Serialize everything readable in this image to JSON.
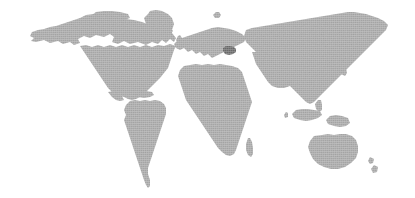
{
  "figure": {
    "type": "world-map",
    "projection": "equirectangular",
    "width": 415,
    "height": 198
  },
  "colors": {
    "background": "#ffffff",
    "land": "#a9a9a9",
    "land_edge": "#b4b4b4",
    "highlight": "#6b6b6b"
  },
  "highlight": {
    "name": "Ukraine",
    "label": "Ukraine",
    "continent": "Europe",
    "color": "#6b6b6b",
    "pixel_center_x": 231,
    "pixel_center_y": 50
  },
  "regions": [
    {
      "name": "north-america",
      "label": "North America"
    },
    {
      "name": "south-america",
      "label": "South America"
    },
    {
      "name": "europe",
      "label": "Europe"
    },
    {
      "name": "africa",
      "label": "Africa"
    },
    {
      "name": "asia",
      "label": "Asia"
    },
    {
      "name": "australia",
      "label": "Australia"
    },
    {
      "name": "new-zealand",
      "label": "New Zealand"
    },
    {
      "name": "greenland",
      "label": "Greenland"
    },
    {
      "name": "madagascar",
      "label": "Madagascar"
    },
    {
      "name": "japan",
      "label": "Japan"
    },
    {
      "name": "british-isles",
      "label": "British Isles"
    },
    {
      "name": "indonesia",
      "label": "Indonesia"
    },
    {
      "name": "philippines",
      "label": "Philippines"
    },
    {
      "name": "caribbean",
      "label": "Caribbean"
    },
    {
      "name": "iceland",
      "label": "Iceland"
    },
    {
      "name": "sri-lanka",
      "label": "Sri Lanka"
    },
    {
      "name": "new-guinea",
      "label": "New Guinea"
    },
    {
      "name": "svalbard",
      "label": "Svalbard"
    },
    {
      "name": "canadian-arctic",
      "label": "Canadian Arctic Islands"
    }
  ],
  "shapes": {
    "north_america": "M32,32 L30,36 L34,38 L31,41 L36,42 L44,40 L50,43 L58,41 L63,44 L70,42 L74,45 L80,43 L78,39 L84,36 L90,38 L96,35 L104,37 L110,34 L114,37 L112,42 L118,44 L124,41 L130,44 L138,42 L146,45 L152,42 L158,44 L162,40 L166,43 L170,39 L174,42 L176,38 L172,33 L166,30 L158,28 L150,25 L142,22 L134,20 L126,19 L118,17 L110,16 L102,15 L94,14 L86,15 L80,18 L74,20 L68,22 L62,24 L56,26 L50,27 L44,29 L38,30 Z M80,46 L84,52 L88,58 L92,64 L96,70 L100,76 L104,82 L108,88 L112,92 L118,95 L124,97 L128,99 L132,100 L136,99 L140,97 L144,94 L148,90 L152,86 L156,82 L160,78 L164,73 L168,68 L170,62 L172,56 L174,50 L176,46 L170,44 L164,46 L158,45 L152,47 L146,45 L140,47 L134,45 L128,47 L122,45 L116,47 L110,45 L104,47 L98,45 L92,47 L86,45 Z M108,92 L112,97 L116,100 L120,101 L124,100 L122,96 L118,93 L114,91 Z",
    "greenland": "M148,14 L144,18 L146,24 L150,30 L156,34 L162,36 L168,34 L172,30 L174,24 L172,18 L168,14 L162,11 L156,10 L150,11 Z",
    "south_america": "M130,101 L126,105 L124,110 L126,115 L124,120 L126,126 L128,132 L130,138 L132,144 L134,150 L136,156 L138,162 L140,168 L142,174 L144,180 L146,185 L148,188 L150,186 L150,180 L148,174 L148,168 L150,162 L152,156 L154,150 L156,144 L158,138 L160,132 L162,126 L164,120 L166,114 L166,108 L164,104 L160,101 L155,100 L150,101 L145,100 L140,101 L135,100 Z",
    "africa": "M184,66 L180,70 L178,76 L180,82 L182,88 L184,94 L186,100 L190,106 L194,112 L198,118 L202,124 L206,130 L210,136 L214,142 L218,148 L222,152 L226,155 L230,156 L234,154 L236,150 L238,144 L240,138 L242,132 L244,126 L246,120 L248,114 L250,108 L252,102 L250,96 L248,90 L246,84 L244,78 L242,72 L238,68 L232,66 L226,65 L220,64 L214,65 L208,64 L202,65 L196,64 L190,65 Z",
    "madagascar": "M248,138 L246,144 L246,150 L248,155 L251,157 L253,154 L253,148 L252,142 L250,138 Z",
    "europe": "M178,40 L174,44 L176,48 L180,50 L184,48 L188,52 L192,50 L196,54 L200,52 L204,56 L208,54 L212,58 L216,56 L220,54 L224,52 L228,50 L232,48 L236,46 L240,44 L244,42 L246,38 L242,34 L236,31 L230,29 L224,28 L218,27 L212,28 L206,30 L200,32 L194,34 L188,36 L182,38 Z",
    "british_isles": "M178,36 L176,40 L178,44 L181,45 L183,42 L182,38 L180,35 Z",
    "iceland": "M168,28 L165,31 L167,34 L171,34 L173,31 L171,28 Z",
    "asia": "M246,30 L244,36 L246,42 L250,46 L254,50 L258,54 L262,58 L266,62 L270,66 L274,70 L278,74 L282,78 L286,82 L290,86 L294,90 L298,94 L302,98 L306,102 L310,104 L314,102 L318,98 L322,94 L326,90 L330,86 L334,82 L338,78 L342,74 L346,70 L350,66 L354,62 L358,58 L362,54 L366,50 L370,46 L374,42 L378,38 L382,34 L386,30 L388,25 L384,21 L378,18 L372,16 L366,14 L360,13 L354,12 L348,12 L342,13 L336,14 L330,15 L324,16 L318,17 L312,18 L306,19 L300,20 L294,21 L288,22 L282,23 L276,24 L270,25 L264,26 L258,27 L252,28 Z M252,52 L254,58 L256,64 L260,70 L264,76 L268,82 L272,86 L278,88 L284,88 L290,86 L294,82 L296,76 L296,70 L294,64 L292,58 L288,54 L282,52 L276,51 L270,52 L264,51 L258,52 Z",
    "japan": "M340,60 L337,64 L338,70 L341,74 L345,76 L347,73 L346,68 L344,63 L342,59 Z",
    "indonesia": "M296,110 L292,114 L294,118 L300,120 L306,121 L312,120 L318,118 L322,115 L320,111 L314,110 L308,109 L302,109 Z",
    "new_guinea": "M330,116 L326,120 L328,124 L334,126 L340,127 L346,126 L350,123 L348,118 L342,116 L336,115 Z",
    "philippines": "M318,100 L315,104 L316,109 L319,112 L322,110 L322,105 L321,100 Z",
    "australia": "M314,136 L310,141 L308,147 L310,153 L313,159 L318,164 L324,167 L331,169 L338,169 L345,167 L351,163 L356,158 L358,152 L358,146 L356,140 L352,136 L346,134 L340,134 L334,135 L328,134 L322,135 Z",
    "new_zealand": "M370,157 L368,161 L370,164 L373,163 L374,159 Z M374,165 L371,169 L373,173 L377,172 L378,167 Z",
    "sri_lanka": "M286,112 L284,115 L285,118 L288,117 L288,113 Z",
    "caribbean": "M140,92 L136,94 L138,97 L144,98 L150,97 L154,95 L152,92 L146,91 Z",
    "svalbard": "M216,12 L213,15 L215,18 L219,18 L221,15 L219,12 Z",
    "canadian_arctic": "M96,12 L92,15 L94,19 L100,21 L108,22 L116,21 L124,20 L130,18 L128,14 L120,12 L112,11 L104,11 Z",
    "ukraine": "M226,46 L223,48 L223,51 L225,54 L229,55 L233,54 L236,52 L236,49 L234,47 L230,46 Z"
  }
}
